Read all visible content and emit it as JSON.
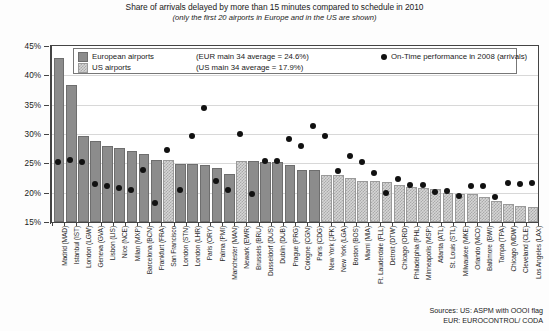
{
  "title": {
    "main": "Share of arrivals delayed by more than 15 minutes compared to schedule in 2010",
    "sub": "(only the first 20 airports in Europe and in the US are shown)"
  },
  "legend": {
    "eur_label": "European airports",
    "eur_avg": "(EUR main 34 average = 24.6%)",
    "us_label": "US airports",
    "us_avg": "(US main 34 average = 17.9%)",
    "dot_label": "On-Time performance in 2008 (arrivals)"
  },
  "sources": {
    "line1": "Sources:  US: ASPM with OOOI flag",
    "line2": "EUR: EUROCONTROL/ CODA"
  },
  "colors": {
    "eur_bar": "#8c8c8c",
    "us_bar": "#d5d5d5",
    "dot": "#111111",
    "axis": "#444444",
    "grid": "#d8d8d8"
  },
  "chart_data": {
    "type": "bar",
    "title": "Share of arrivals delayed by more than 15 minutes compared to schedule in 2010",
    "subtitle": "(only the first 20 airports in Europe and in the US are shown)",
    "xlabel": "",
    "ylabel": "",
    "ylim": [
      15,
      45
    ],
    "yticks": [
      "15%",
      "20%",
      "25%",
      "30%",
      "35%",
      "40%",
      "45%"
    ],
    "grid": true,
    "legend_position": "top-inside",
    "categories": [
      "Madrid (MAD)",
      "Istanbul (IST)",
      "London (LGW)",
      "Geneva (GVA)",
      "Lisbon (LIS)",
      "Nice (NCE)",
      "Milan (MXP)",
      "Barcelona (BCN)",
      "Frankfurt (FRA)",
      "San Francisco",
      "London (STN)",
      "London (LHR)",
      "Paris (ORY)",
      "Palma (PMI)",
      "Manchester (MAN)",
      "Newark (EWR)",
      "Brussels (BRU)",
      "Dusseldorf (DUS)",
      "Dublin (DUB)",
      "Prague (PRG)",
      "Cologne (CGN)",
      "Paris (CDG)",
      "New York (JFK)",
      "New York (LGA)",
      "Boston (BOS)",
      "Miami (MIA)",
      "Ft. Lauderdale (FLL)",
      "Detroit (DTW)",
      "Chicago (ORD)",
      "Philadelphia (PHL)",
      "Minneapolis (MSP)",
      "Atlanta (ATL)",
      "St. Louis (STL)",
      "Milwaukee (MKE)",
      "Orlando (MCO)",
      "Baltimore (BWI)",
      "Tampa (TPA)",
      "Chicago (MDW)",
      "Cleveland (CLE)",
      "Los Angeles (LAX)"
    ],
    "group": [
      "EUR",
      "EUR",
      "EUR",
      "EUR",
      "EUR",
      "EUR",
      "EUR",
      "EUR",
      "EUR",
      "US",
      "EUR",
      "EUR",
      "EUR",
      "EUR",
      "EUR",
      "US",
      "EUR",
      "EUR",
      "EUR",
      "EUR",
      "EUR",
      "EUR",
      "US",
      "US",
      "US",
      "US",
      "US",
      "US",
      "US",
      "US",
      "US",
      "US",
      "US",
      "US",
      "US",
      "US",
      "US",
      "US",
      "US",
      "US"
    ],
    "series": [
      {
        "name": "Share of arrivals delayed by more than 15 minutes (2010)",
        "type": "bar",
        "values": [
          42.6,
          38.0,
          29.3,
          28.5,
          27.7,
          27.2,
          26.8,
          26.3,
          25.3,
          25.2,
          24.5,
          24.5,
          24.3,
          23.9,
          22.8,
          25.0,
          25.0,
          24.9,
          24.9,
          24.3,
          23.6,
          23.5,
          22.6,
          22.6,
          22.1,
          21.7,
          21.6,
          21.5,
          21.0,
          20.6,
          20.5,
          20.3,
          19.6,
          19.5,
          19.5,
          18.9,
          18.3,
          17.8,
          17.4,
          17.3
        ]
      },
      {
        "name": "On-Time performance in 2008 (arrivals)",
        "type": "scatter",
        "values": [
          25.2,
          25.6,
          25.3,
          21.5,
          21.2,
          20.8,
          20.4,
          23.9,
          18.2,
          27.3,
          20.4,
          29.6,
          34.5,
          22.0,
          20.5,
          30.0,
          19.7,
          25.4,
          25.4,
          29.2,
          28.0,
          31.3,
          29.6,
          23.7,
          26.3,
          25.2,
          23.4,
          20.0,
          22.3,
          21.3,
          21.3,
          20.1,
          20.3,
          19.4,
          21.2,
          21.2,
          19.2,
          21.6,
          21.5,
          21.7
        ]
      }
    ]
  }
}
